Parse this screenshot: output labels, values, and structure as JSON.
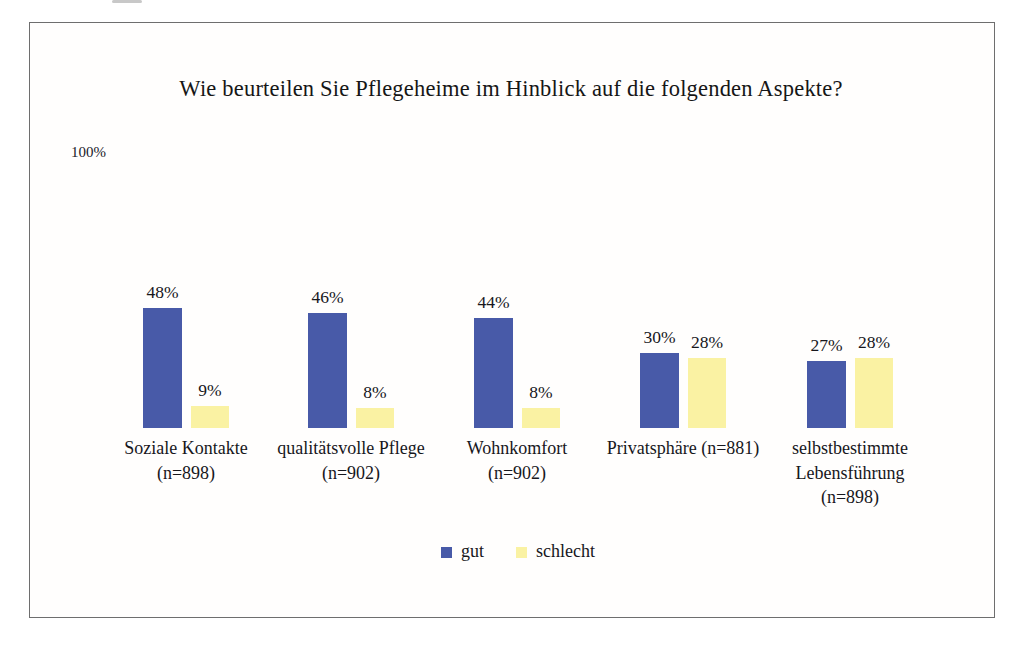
{
  "page": {
    "background": "#ffffff",
    "frame_border_color": "#6e6e6e",
    "text_color": "#1c1c1c"
  },
  "chart_data": {
    "type": "bar",
    "title": "Wie beurteilen Sie Pflegeheime im Hinblick auf die folgenden Aspekte?",
    "xlabel": "",
    "ylabel": "",
    "ylim": [
      0,
      100
    ],
    "grid": false,
    "axes_visible": false,
    "ytick_top_label": "100%",
    "value_label_suffix": "%",
    "categories": [
      "Soziale Kontakte (n=898)",
      "qualitätsvolle Pflege (n=902)",
      "Wohnkomfort (n=902)",
      "Privatsphäre (n=881)",
      "selbstbestimmte Lebensführung (n=898)"
    ],
    "category_label_lines": [
      [
        "Soziale Kontakte",
        "(n=898)"
      ],
      [
        "qualitätsvolle Pflege",
        "(n=902)"
      ],
      [
        "Wohnkomfort",
        "(n=902)"
      ],
      [
        "Privatsphäre (n=881)"
      ],
      [
        "selbstbestimmte",
        "Lebensführung",
        "(n=898)"
      ]
    ],
    "series": [
      {
        "name": "gut",
        "color": "#485aa8",
        "values": [
          48,
          46,
          44,
          30,
          27
        ]
      },
      {
        "name": "schlecht",
        "color": "#faf2a3",
        "values": [
          9,
          8,
          8,
          28,
          28
        ]
      }
    ],
    "legend": {
      "position": "bottom-center",
      "entries": [
        "gut",
        "schlecht"
      ]
    }
  }
}
